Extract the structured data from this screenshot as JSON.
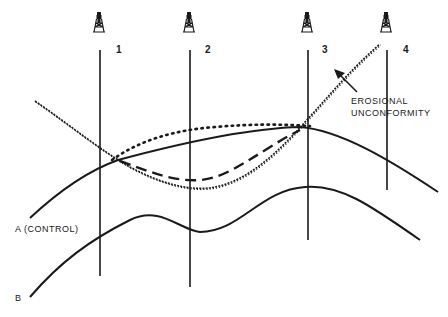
{
  "diagram": {
    "type": "geologic-cross-section",
    "colors": {
      "ink": "#1a1a1a",
      "background": "#ffffff"
    },
    "wells": [
      {
        "id": "1",
        "label": "1",
        "icon": "oil-derrick-icon"
      },
      {
        "id": "2",
        "label": "2",
        "icon": "oil-derrick-icon"
      },
      {
        "id": "3",
        "label": "3",
        "icon": "oil-derrick-icon"
      },
      {
        "id": "4",
        "label": "4",
        "icon": "oil-derrick-icon"
      }
    ],
    "horizons": [
      {
        "id": "A",
        "label": "A (CONTROL)",
        "style": "solid"
      },
      {
        "id": "B",
        "label": "B",
        "style": "solid"
      }
    ],
    "surfaces": [
      {
        "id": "unconformity",
        "style": "wavy"
      },
      {
        "id": "dotted-interpretation",
        "style": "dotted"
      },
      {
        "id": "dashed-interpretation",
        "style": "dashed"
      }
    ],
    "annotation": {
      "line1": "EROSIONAL",
      "line2": "UNCONFORMITY"
    }
  }
}
